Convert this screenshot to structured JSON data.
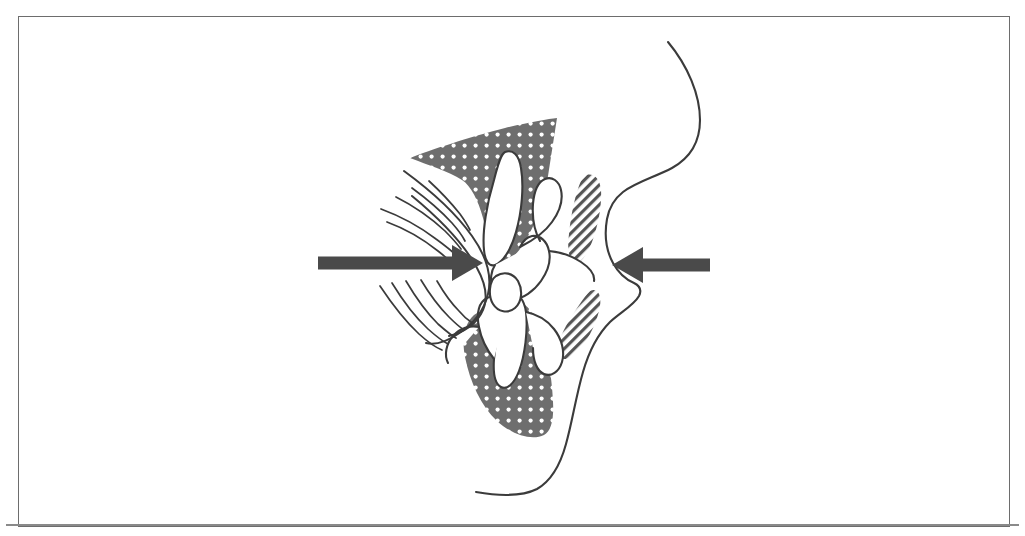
{
  "figure": {
    "kind": "anatomical-line-drawing",
    "caption": "",
    "background_color": "#ffffff",
    "frame": {
      "visible": true,
      "border_color": "#6d6d6d",
      "border_width_px": 1.5,
      "x": 18,
      "y": 16,
      "width": 992,
      "height": 511
    },
    "bottom_rule": {
      "visible": true,
      "color": "#8a8a8a",
      "x": 6,
      "y": 524,
      "width": 1013,
      "height": 2
    }
  },
  "palette": {
    "ink": "#3b3b3b",
    "outline": "#404040",
    "arrow_fill": "#4a4a4a",
    "dotted_fill": "#6e6e6e",
    "dotted_dot": "#ffffff",
    "hatch_line": "#555555",
    "hatch_bg": "#ffffff",
    "paper": "#ffffff"
  },
  "elements": {
    "arrow_left": {
      "name": "left-force-arrow",
      "direction": "points-right",
      "label": "",
      "color": "#4a4a4a",
      "shaft": {
        "x1": 318,
        "y1": 263,
        "x2": 455,
        "y2": 263,
        "thickness": 13
      },
      "head": {
        "tip_x": 483,
        "tip_y": 263,
        "back_x": 452,
        "half_height": 18
      }
    },
    "arrow_right": {
      "name": "right-force-arrow",
      "direction": "points-left",
      "label": "",
      "color": "#4a4a4a",
      "shaft": {
        "x1": 710,
        "y1": 265,
        "x2": 640,
        "y2": 265,
        "thickness": 13
      },
      "head": {
        "tip_x": 612,
        "tip_y": 265,
        "back_x": 643,
        "half_height": 18
      }
    },
    "motion_arcs": {
      "name": "tongue-motion-arcs",
      "count_upper": 5,
      "count_lower": 5,
      "stroke": "#3b3b3b",
      "stroke_width": 1.6
    },
    "tongue_upper": {
      "name": "upper-tongue-dotted-region",
      "fill_pattern": "dotted",
      "fill_color": "#6e6e6e",
      "dot_color": "#ffffff"
    },
    "tongue_lower": {
      "name": "lower-tongue-dotted-region",
      "fill_pattern": "dotted",
      "fill_color": "#6e6e6e",
      "dot_color": "#ffffff"
    },
    "lip_upper": {
      "name": "upper-lip-hatched-region",
      "fill_pattern": "diagonal-hatch",
      "hatch_color": "#555555",
      "hatch_angle_deg": 45
    },
    "lip_lower": {
      "name": "lower-lip-hatched-region",
      "fill_pattern": "diagonal-hatch",
      "hatch_color": "#555555",
      "hatch_angle_deg": 45
    },
    "facial_profile": {
      "name": "facial-profile-outline",
      "stroke": "#3b3b3b",
      "stroke_width": 2
    },
    "teeth": {
      "name": "teeth-and-alveolar-outline",
      "stroke": "#3b3b3b",
      "stroke_width": 2,
      "count_visible": 4
    }
  }
}
